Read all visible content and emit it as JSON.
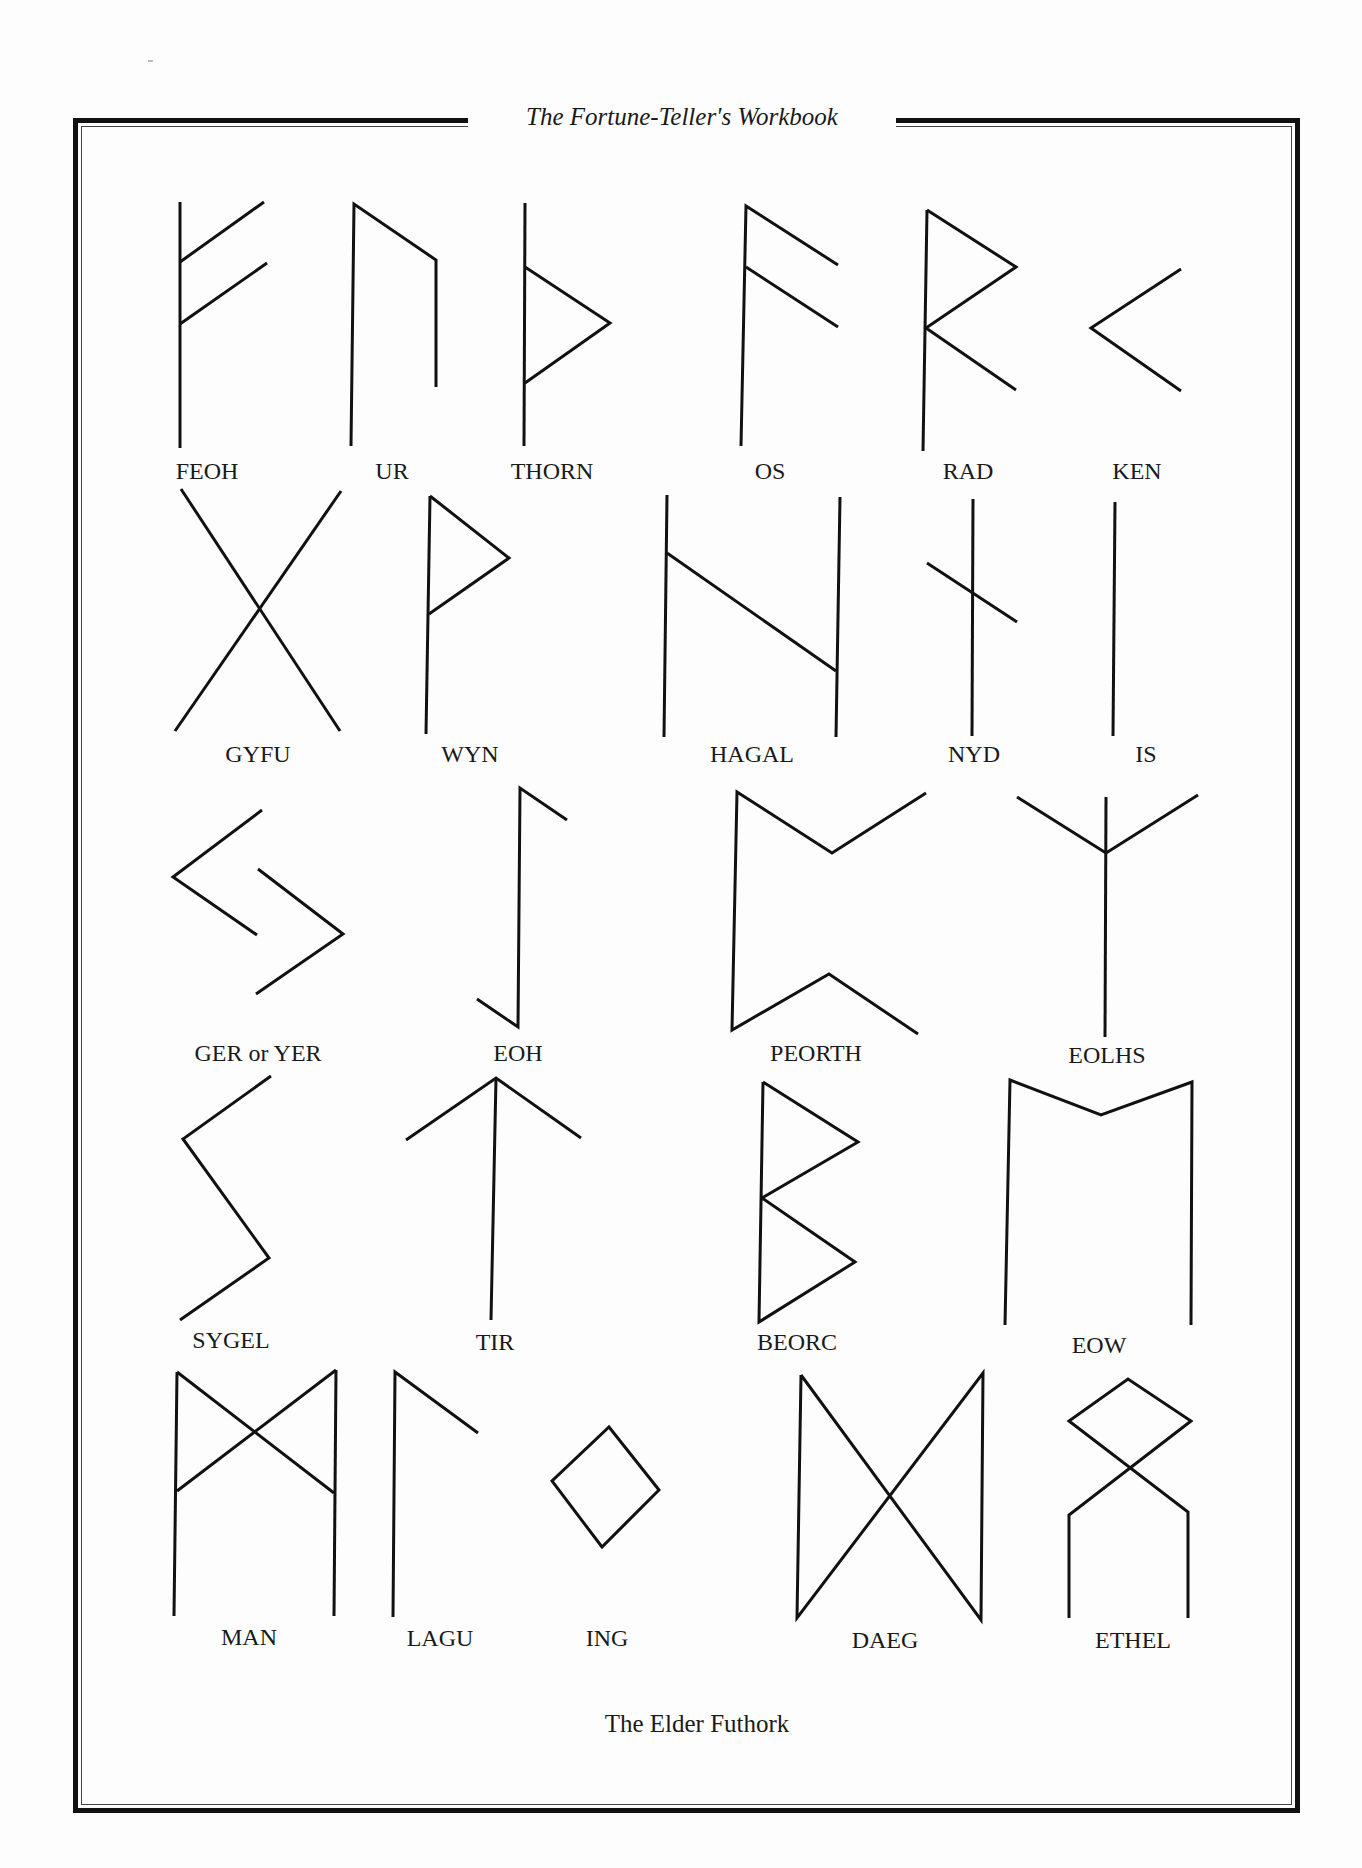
{
  "header": {
    "title": "The Fortune-Teller's Workbook"
  },
  "caption": "The Elder Futhork",
  "runes": [
    {
      "name": "FEOH"
    },
    {
      "name": "UR"
    },
    {
      "name": "THORN"
    },
    {
      "name": "OS"
    },
    {
      "name": "RAD"
    },
    {
      "name": "KEN"
    },
    {
      "name": "GYFU"
    },
    {
      "name": "WYN"
    },
    {
      "name": "HAGAL"
    },
    {
      "name": "NYD"
    },
    {
      "name": "IS"
    },
    {
      "name": "GER or YER"
    },
    {
      "name": "EOH"
    },
    {
      "name": "PEORTH"
    },
    {
      "name": "EOLHS"
    },
    {
      "name": "SYGEL"
    },
    {
      "name": "TIR"
    },
    {
      "name": "BEORC"
    },
    {
      "name": "EOW"
    },
    {
      "name": "MAN"
    },
    {
      "name": "LAGU"
    },
    {
      "name": "ING"
    },
    {
      "name": "DAEG"
    },
    {
      "name": "ETHEL"
    }
  ]
}
